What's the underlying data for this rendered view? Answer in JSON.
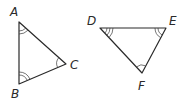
{
  "diagram": {
    "type": "similar-triangles",
    "triangles": [
      {
        "name": "ABC",
        "vertices": [
          {
            "label": "A",
            "x": 19,
            "y": 22,
            "angle_marks": 2
          },
          {
            "label": "B",
            "x": 19,
            "y": 84,
            "angle_marks": 2
          },
          {
            "label": "C",
            "x": 66,
            "y": 64,
            "angle_marks": 1
          }
        ]
      },
      {
        "name": "DEF",
        "vertices": [
          {
            "label": "D",
            "x": 100,
            "y": 28,
            "angle_marks": 3
          },
          {
            "label": "E",
            "x": 166,
            "y": 28,
            "angle_marks": 2
          },
          {
            "label": "F",
            "x": 142,
            "y": 73,
            "angle_marks": 1
          }
        ]
      }
    ],
    "labels": {
      "A": "A",
      "B": "B",
      "C": "C",
      "D": "D",
      "E": "E",
      "F": "F"
    },
    "colors": {
      "stroke": "#2a2a2a",
      "background": "#ffffff"
    }
  }
}
